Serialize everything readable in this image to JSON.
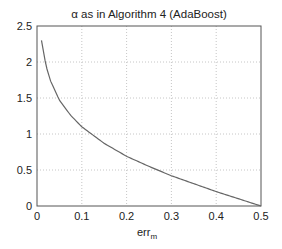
{
  "chart_data": {
    "type": "line",
    "title": "α as in Algorithm 4 (AdaBoost)",
    "xlabel": "err_m",
    "xlabel_main": "err",
    "xlabel_sub": "m",
    "ylabel": "",
    "xlim": [
      0,
      0.5
    ],
    "ylim": [
      0,
      2.5
    ],
    "xticks": [
      0,
      0.1,
      0.2,
      0.3,
      0.4,
      0.5
    ],
    "xtick_labels": [
      "0",
      "0.1",
      "0.2",
      "0.3",
      "0.4",
      "0.5"
    ],
    "yticks": [
      0,
      0.5,
      1,
      1.5,
      2,
      2.5
    ],
    "ytick_labels": [
      "0",
      "0.5",
      "1",
      "1.5",
      "2",
      "2.5"
    ],
    "grid": true,
    "legend": null,
    "series": [
      {
        "name": "alpha = 0.5 * ln((1 - err_m) / err_m)",
        "x": [
          0.01,
          0.02,
          0.03,
          0.05,
          0.075,
          0.1,
          0.15,
          0.2,
          0.25,
          0.3,
          0.35,
          0.4,
          0.45,
          0.5
        ],
        "y": [
          2.3,
          1.95,
          1.74,
          1.47,
          1.26,
          1.1,
          0.87,
          0.69,
          0.55,
          0.42,
          0.31,
          0.2,
          0.1,
          0.0
        ]
      }
    ],
    "colors": {
      "curve": "#666666",
      "frame": "#555555",
      "grid": "#b8b8b8"
    }
  }
}
